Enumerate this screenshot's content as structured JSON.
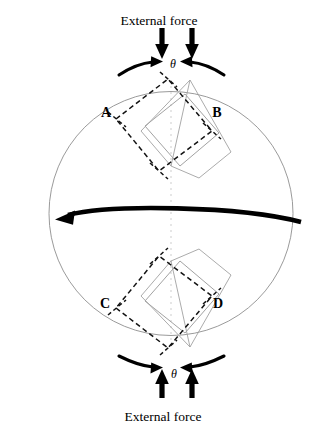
{
  "figure": {
    "title_top": "External  force",
    "title_bottom": "External force",
    "angle_symbol_top": "θ",
    "angle_symbol_bottom": "θ",
    "corner_labels": [
      {
        "id": "A",
        "text": "A",
        "x": 106,
        "y": 117
      },
      {
        "id": "B",
        "text": "B",
        "x": 212,
        "y": 117
      },
      {
        "id": "C",
        "text": "C",
        "x": 105,
        "y": 308
      },
      {
        "id": "D",
        "text": "D",
        "x": 213,
        "y": 308
      }
    ],
    "colors": {
      "outline": "#8a8a8a",
      "grain_gray": "#9a9a9a",
      "dashed_black": "#111111",
      "arrow_black": "#000000",
      "centerline": "#d8d8d8",
      "background": "#ffffff"
    },
    "circle": {
      "label": "grain boundary circle",
      "cx": 171,
      "cy": 213.5,
      "r": 122
    },
    "shear_arrow": {
      "label": "shear direction arrow",
      "direction": "left",
      "from_x": 300,
      "to_x": 57,
      "y": 215
    },
    "centerline": {
      "label": "vertical symmetry axis",
      "x": 171,
      "y1": 80,
      "y2": 350
    },
    "top_unit": {
      "label": "upper deformed lattice cell",
      "gray_square": [
        [
          145,
          126
        ],
        [
          185,
          94
        ],
        [
          219,
          133
        ],
        [
          180,
          166
        ]
      ],
      "dashed_square": [
        [
          116,
          119
        ],
        [
          168,
          79
        ],
        [
          212,
          131
        ],
        [
          159,
          171
        ]
      ],
      "radial_lines": [
        [
          [
            190,
            80
          ],
          [
            143,
            130
          ]
        ],
        [
          [
            190,
            80
          ],
          [
            230,
            151
          ]
        ],
        [
          [
            190,
            80
          ],
          [
            171,
            165
          ]
        ]
      ]
    },
    "bottom_unit": {
      "label": "lower deformed lattice cell",
      "gray_square": [
        [
          145,
          301
        ],
        [
          185,
          333
        ],
        [
          219,
          294
        ],
        [
          180,
          261
        ]
      ],
      "dashed_square": [
        [
          116,
          308
        ],
        [
          168,
          348
        ],
        [
          212,
          296
        ],
        [
          159,
          256
        ]
      ],
      "radial_lines": [
        [
          [
            190,
            347
          ],
          [
            143,
            297
          ]
        ],
        [
          [
            190,
            347
          ],
          [
            230,
            276
          ]
        ],
        [
          [
            190,
            347
          ],
          [
            171,
            262
          ]
        ]
      ]
    },
    "force_arrows_top": [
      {
        "label": "left downward force arrow",
        "x": 162,
        "y1": 28,
        "y2": 57
      },
      {
        "label": "right downward force arrow",
        "x": 192,
        "y1": 28,
        "y2": 57
      }
    ],
    "force_arrows_bottom": [
      {
        "label": "left upward force arrow",
        "x": 162,
        "y1": 398,
        "y2": 371
      },
      {
        "label": "right upward force arrow",
        "x": 192,
        "y1": 398,
        "y2": 371
      }
    ],
    "rotation_arrows_top": [
      {
        "label": "top-left clockwise rotation arrow"
      },
      {
        "label": "top-right counter-clockwise rotation arrow"
      }
    ],
    "rotation_arrows_bottom": [
      {
        "label": "bottom-left rotation arrow"
      },
      {
        "label": "bottom-right rotation arrow"
      }
    ]
  }
}
